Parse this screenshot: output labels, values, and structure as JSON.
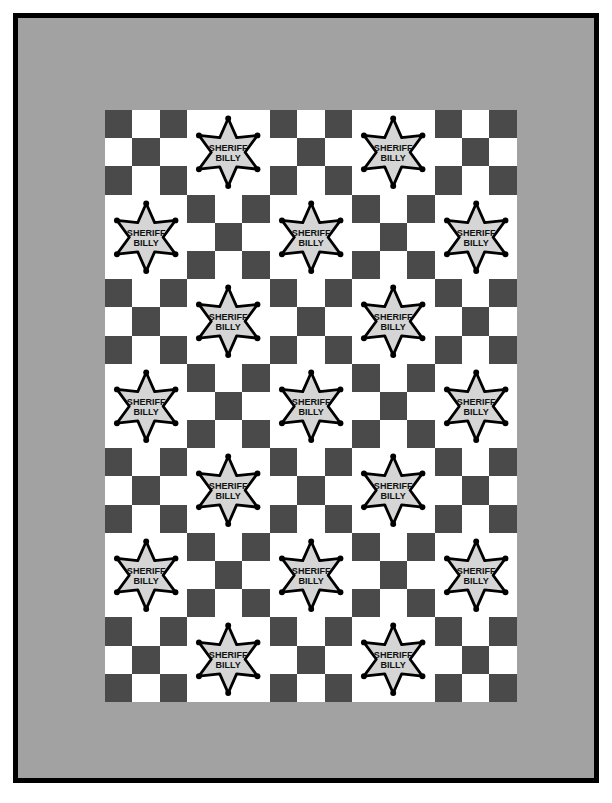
{
  "document": {
    "kind": "quilt-pattern-diagram",
    "title": "Sheriff Billy Star Quilt Layout"
  },
  "colors": {
    "binding": "#000000",
    "sashing_gray": "#a2a2a2",
    "checker_dark": "#4a4a4a",
    "checker_light": "#ffffff",
    "badge_fill": "#d5d5d5",
    "badge_outline": "#000000",
    "badge_text": "#111111",
    "background": "#ffffff"
  },
  "badge": {
    "line1": "SHERIFF",
    "line2": "BILLY",
    "points": 6,
    "dot_count": 6
  },
  "layout": {
    "grid_columns": 5,
    "grid_rows": 7,
    "block_size_px": 82,
    "corner_units": 3
  },
  "corner_blocks": [
    {
      "name": "top-left",
      "pattern": [
        [
          "d",
          "l",
          "d"
        ],
        [
          "l",
          "d",
          "l"
        ],
        [
          "d",
          "l",
          "d"
        ]
      ]
    },
    {
      "name": "top-right",
      "pattern": [
        [
          "d",
          "l",
          "d"
        ],
        [
          "l",
          "d",
          "l"
        ],
        [
          "d",
          "l",
          "d"
        ]
      ]
    },
    {
      "name": "bottom-left",
      "pattern": [
        [
          "d",
          "l",
          "d"
        ],
        [
          "l",
          "d",
          "l"
        ],
        [
          "d",
          "l",
          "d"
        ]
      ]
    },
    {
      "name": "bottom-right",
      "pattern": [
        [
          "d",
          "l",
          "d"
        ],
        [
          "l",
          "d",
          "l"
        ],
        [
          "d",
          "l",
          "d"
        ]
      ]
    }
  ],
  "checker_pattern": [
    [
      "d",
      "l",
      "d"
    ],
    [
      "l",
      "d",
      "l"
    ],
    [
      "d",
      "l",
      "d"
    ]
  ],
  "center_grid": [
    [
      "checker",
      "star",
      "checker",
      "star",
      "checker"
    ],
    [
      "star",
      "checker",
      "star",
      "checker",
      "star"
    ],
    [
      "checker",
      "star",
      "checker",
      "star",
      "checker"
    ],
    [
      "star",
      "checker",
      "star",
      "checker",
      "star"
    ],
    [
      "checker",
      "star",
      "checker",
      "star",
      "checker"
    ],
    [
      "star",
      "checker",
      "star",
      "checker",
      "star"
    ],
    [
      "checker",
      "star",
      "checker",
      "star",
      "checker"
    ]
  ],
  "counts": {
    "star_blocks": 17,
    "checker_blocks": 18,
    "total_blocks": 35
  }
}
